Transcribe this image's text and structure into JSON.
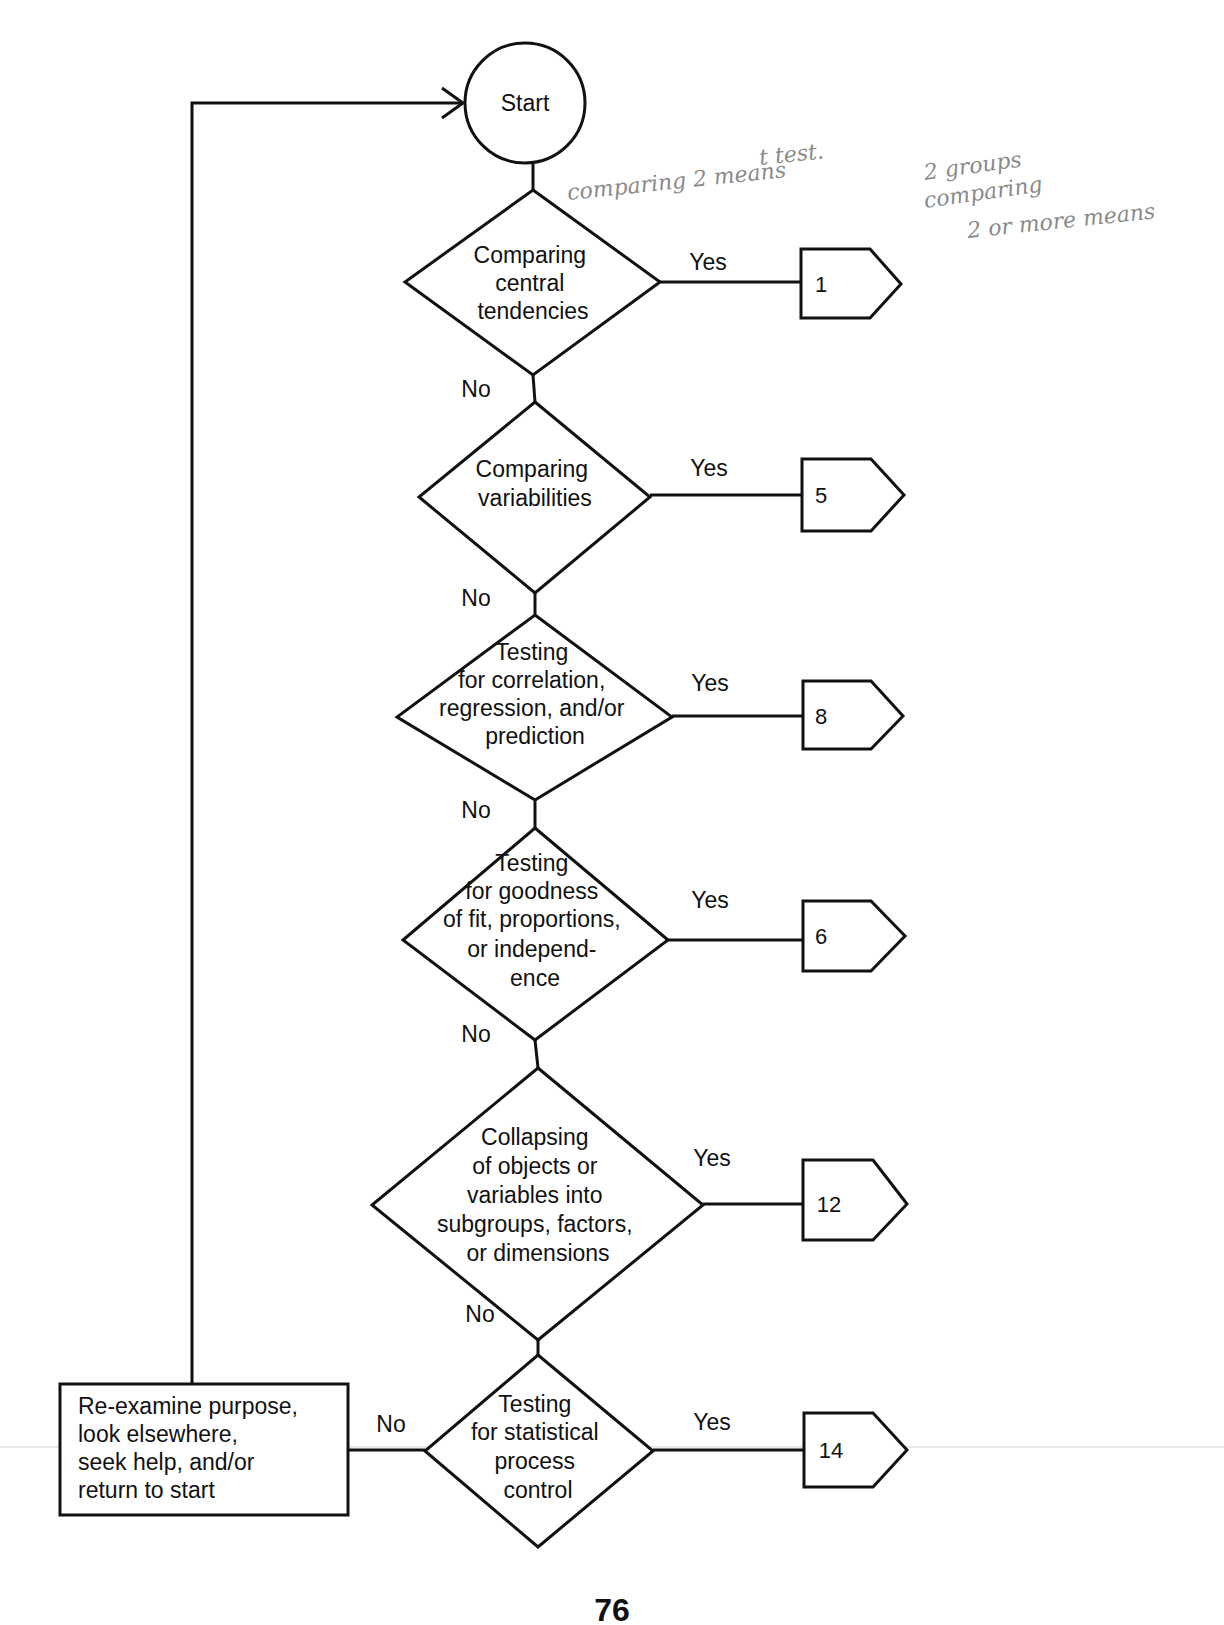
{
  "start": {
    "label": "Start"
  },
  "decisions": [
    {
      "lines": [
        "Comparing",
        "central",
        "tendencies"
      ],
      "yes": "Yes",
      "no": "No",
      "connector": "1"
    },
    {
      "lines": [
        "Comparing",
        "variabilities"
      ],
      "yes": "Yes",
      "no": "No",
      "connector": "5"
    },
    {
      "lines": [
        "Testing",
        "for correlation,",
        "regression, and/or",
        "prediction"
      ],
      "yes": "Yes",
      "no": "No",
      "connector": "8"
    },
    {
      "lines": [
        "Testing",
        "for goodness",
        "of fit, proportions,",
        "or independ-",
        "ence"
      ],
      "yes": "Yes",
      "no": "No",
      "connector": "6"
    },
    {
      "lines": [
        "Collapsing",
        "of objects or",
        "variables into",
        "subgroups, factors,",
        "or dimensions"
      ],
      "yes": "Yes",
      "no": "No",
      "connector": "12"
    },
    {
      "lines": [
        "Testing",
        "for statistical",
        "process",
        "control"
      ],
      "yes": "Yes",
      "no": "No",
      "connector": "14"
    }
  ],
  "fallback": {
    "lines": [
      "Re-examine purpose,",
      "look elsewhere,",
      "seek help, and/or",
      "return to start"
    ]
  },
  "handwritten_notes": [
    "comparing 2 means",
    "t test.",
    "2 groups",
    "comparing",
    "2 or more means"
  ],
  "page_number": "76"
}
